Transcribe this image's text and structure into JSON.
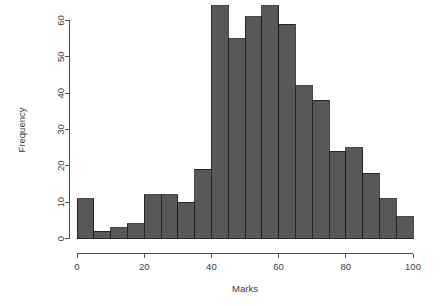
{
  "chart_data": {
    "type": "bar",
    "title": "",
    "subtitle": "",
    "xlabel": "Marks",
    "ylabel": "Frequency",
    "xlim": [
      0,
      100
    ],
    "ylim": [
      0,
      64
    ],
    "grid": false,
    "legend": false,
    "bin_width": 5,
    "bar_color": "#585858",
    "bar_border_color": "#1a1a1a",
    "axis_color": "#4d4d4d",
    "background": "#ffffff",
    "xticks": [
      0,
      20,
      40,
      60,
      80,
      100
    ],
    "xtick_labels": [
      "0",
      "20",
      "40",
      "60",
      "80",
      "100"
    ],
    "yticks": [
      0,
      10,
      20,
      30,
      40,
      50,
      60
    ],
    "ytick_labels": [
      "0",
      "10",
      "20",
      "30",
      "40",
      "50",
      "60"
    ],
    "categories": [
      "0-5",
      "5-10",
      "10-15",
      "15-20",
      "20-25",
      "25-30",
      "30-35",
      "35-40",
      "40-45",
      "45-50",
      "50-55",
      "55-60",
      "60-65",
      "65-70",
      "70-75",
      "75-80",
      "80-85",
      "85-90",
      "90-95",
      "95-100"
    ],
    "bin_edges": [
      0,
      5,
      10,
      15,
      20,
      25,
      30,
      35,
      40,
      45,
      50,
      55,
      60,
      65,
      70,
      75,
      80,
      85,
      90,
      95,
      100
    ],
    "values": [
      11,
      2,
      3,
      4,
      12,
      12,
      10,
      19,
      64,
      55,
      61,
      64,
      59,
      42,
      38,
      24,
      25,
      18,
      11,
      6
    ]
  }
}
